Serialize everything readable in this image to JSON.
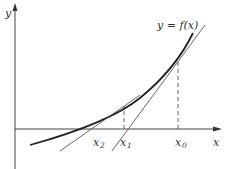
{
  "diagram": {
    "curve_label": "y = f(x)",
    "axes": {
      "x_label": "x",
      "y_label": "y"
    },
    "points": [
      {
        "name": "x2",
        "label_base": "x",
        "label_sub": "2"
      },
      {
        "name": "x1",
        "label_base": "x",
        "label_sub": "1"
      },
      {
        "name": "x0",
        "label_base": "x",
        "label_sub": "0"
      }
    ],
    "colors": {
      "axis": "#444444",
      "curve": "#222222",
      "tangent": "#555555",
      "dashed": "#555555",
      "background": "#ffffff"
    }
  }
}
